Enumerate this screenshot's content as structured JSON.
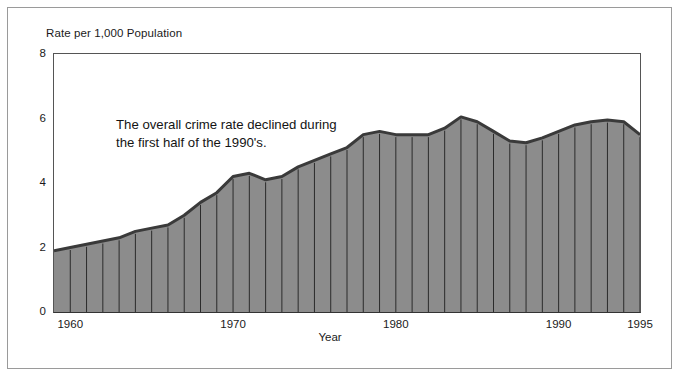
{
  "figure": {
    "y_axis_title": "Rate per 1,000 Population",
    "x_axis_title": "Year",
    "annotation_line1": "The overall crime rate declined during",
    "annotation_line2": "the first half of the 1990's.",
    "fill_color": "#8c8c8c",
    "edge_color": "#3a3a3a",
    "divider_color": "#2b2b2b",
    "axis_color": "#444444",
    "frame_color": "#9a9a9a"
  },
  "chart_data": {
    "type": "area",
    "title": "",
    "subtitle": "",
    "annotation": "The overall crime rate declined during the first half of the 1990's.",
    "xlabel": "Year",
    "ylabel": "Rate per 1,000 Population",
    "xlim": [
      1959,
      1995
    ],
    "ylim": [
      0,
      8
    ],
    "grid": false,
    "legend": "none",
    "y_ticks": [
      0,
      2,
      4,
      6,
      8
    ],
    "x_ticks": [
      1960,
      1970,
      1980,
      1990,
      1995
    ],
    "x_tick_labels": [
      "1960",
      "1970",
      "1980",
      "1990",
      "1995"
    ],
    "y_tick_labels": [
      "0",
      "2",
      "4",
      "6",
      "8"
    ],
    "x": [
      1959,
      1960,
      1961,
      1962,
      1963,
      1964,
      1965,
      1966,
      1967,
      1968,
      1969,
      1970,
      1971,
      1972,
      1973,
      1974,
      1975,
      1976,
      1977,
      1978,
      1979,
      1980,
      1981,
      1982,
      1983,
      1984,
      1985,
      1986,
      1987,
      1988,
      1989,
      1990,
      1991,
      1992,
      1993,
      1994,
      1995
    ],
    "values": [
      1.9,
      2.0,
      2.1,
      2.2,
      2.3,
      2.5,
      2.6,
      2.7,
      3.0,
      3.4,
      3.7,
      4.2,
      4.3,
      4.1,
      4.2,
      4.5,
      4.7,
      4.9,
      5.1,
      5.5,
      5.6,
      5.5,
      5.5,
      5.5,
      5.7,
      6.05,
      5.9,
      5.6,
      5.3,
      5.25,
      5.4,
      5.6,
      5.8,
      5.9,
      5.95,
      5.9,
      5.5
    ],
    "series": [
      {
        "name": "Crime rate",
        "values": [
          1.9,
          2.0,
          2.1,
          2.2,
          2.3,
          2.5,
          2.6,
          2.7,
          3.0,
          3.4,
          3.7,
          4.2,
          4.3,
          4.1,
          4.2,
          4.5,
          4.7,
          4.9,
          5.1,
          5.5,
          5.6,
          5.5,
          5.5,
          5.5,
          5.7,
          6.05,
          5.9,
          5.6,
          5.3,
          5.25,
          5.4,
          5.6,
          5.8,
          5.9,
          5.95,
          5.9,
          5.5
        ]
      }
    ]
  }
}
